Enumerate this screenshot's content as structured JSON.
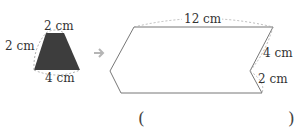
{
  "small_shape": {
    "type": "trapezoid",
    "labels": {
      "top": "2 cm",
      "left": "2 cm",
      "bottom": "4 cm"
    },
    "fill": "#3d3d3d"
  },
  "arrow": {
    "icon": "right-arrow-icon",
    "color": "#b5b5b5"
  },
  "large_shape": {
    "labels": {
      "top": "12 cm",
      "upper_right": "4 cm",
      "lower_right": "2 cm"
    },
    "stroke": "#777777"
  },
  "answer": {
    "open": "(",
    "close": ")",
    "value": ""
  }
}
